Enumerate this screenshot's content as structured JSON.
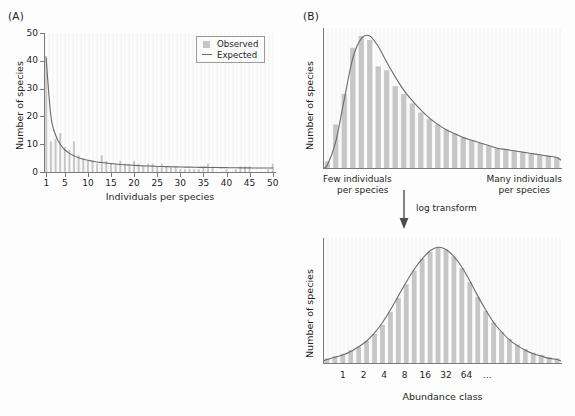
{
  "figure": {
    "panels": [
      {
        "id": "A",
        "label": "(A)"
      },
      {
        "id": "B",
        "label": "(B)"
      }
    ],
    "arrow": {
      "label": "log transform",
      "direction": "down"
    },
    "colors": {
      "bar": "#c6c6c6",
      "curve": "#6b6b6b",
      "axis": "#7a7a7a",
      "plot_background": "#f7f7f7",
      "text": "#231f20"
    }
  },
  "chart_data": [
    {
      "id": "panel-a",
      "type": "bar",
      "title": "",
      "xlabel": "Individuals per species",
      "ylabel": "Number of species",
      "xlim": [
        0.4,
        50.6
      ],
      "ylim": [
        0,
        50
      ],
      "xticks": [
        1,
        5,
        10,
        15,
        20,
        25,
        30,
        35,
        40,
        45,
        50
      ],
      "yticks": [
        0,
        10,
        20,
        30,
        40,
        50
      ],
      "grid": false,
      "legend": {
        "position": "top-right",
        "entries": [
          {
            "label": "Observed",
            "marker": "square",
            "color": "#c6c6c6"
          },
          {
            "label": "Expected",
            "marker": "line",
            "color": "#6b6b6b"
          }
        ]
      },
      "categories": [
        1,
        2,
        3,
        4,
        5,
        6,
        7,
        8,
        9,
        10,
        11,
        12,
        13,
        14,
        15,
        16,
        17,
        18,
        19,
        20,
        21,
        22,
        23,
        24,
        25,
        26,
        27,
        28,
        29,
        30,
        31,
        32,
        33,
        34,
        35,
        36,
        37,
        38,
        39,
        40,
        41,
        42,
        43,
        44,
        45,
        46,
        47,
        48,
        49,
        50
      ],
      "series": [
        {
          "name": "Observed",
          "type": "bar",
          "values": [
            41,
            11,
            12,
            14,
            9,
            8,
            11,
            6,
            5,
            4,
            4,
            3,
            6,
            4,
            3,
            3,
            4,
            3,
            3,
            4,
            3,
            2,
            3,
            3,
            2,
            3,
            2,
            2,
            2,
            1,
            1,
            1,
            1,
            1,
            2,
            3,
            2,
            0,
            0,
            1,
            0,
            1,
            2,
            2,
            2,
            0,
            0,
            0,
            1,
            3
          ]
        },
        {
          "name": "Expected",
          "type": "line",
          "values": [
            40.0,
            20.0,
            13.3,
            10.0,
            8.0,
            6.7,
            5.8,
            5.1,
            4.6,
            4.2,
            3.9,
            3.6,
            3.4,
            3.2,
            3.0,
            2.9,
            2.7,
            2.6,
            2.5,
            2.4,
            2.3,
            2.2,
            2.15,
            2.1,
            2.0,
            1.96,
            1.92,
            1.88,
            1.84,
            1.8,
            1.77,
            1.74,
            1.71,
            1.68,
            1.66,
            1.64,
            1.62,
            1.6,
            1.58,
            1.56,
            1.54,
            1.52,
            1.5,
            1.49,
            1.47,
            1.46,
            1.45,
            1.44,
            1.43,
            1.42
          ]
        }
      ]
    },
    {
      "id": "panel-b-top",
      "type": "bar",
      "title": "",
      "xlabel": "",
      "ylabel": "Number of species",
      "x_left_caption": "Few individuals per species",
      "x_right_caption": "Many individuals per species",
      "xticks": [],
      "yticks": [],
      "grid": false,
      "distribution": "lognormal (untransformed abundance)",
      "categories": [
        1,
        2,
        3,
        4,
        5,
        6,
        7,
        8,
        9,
        10,
        11,
        12,
        13,
        14,
        15,
        16,
        17,
        18,
        19,
        20,
        21,
        22,
        23,
        24,
        25,
        26,
        27,
        28
      ],
      "series": [
        {
          "name": "Observed",
          "type": "bar",
          "values": [
            5,
            33,
            56,
            91,
            100,
            97,
            77,
            74,
            62,
            56,
            49,
            42,
            37,
            33,
            29,
            26,
            23,
            21,
            19,
            17,
            15,
            14,
            13,
            12,
            11,
            10,
            9,
            8
          ]
        },
        {
          "name": "Expected",
          "type": "line",
          "values": [
            2,
            20,
            52,
            83,
            98,
            100,
            92,
            80,
            69,
            59,
            51,
            44,
            38,
            33,
            29,
            26,
            23,
            21,
            19,
            17,
            15,
            14,
            13,
            12,
            11,
            10,
            9,
            8
          ]
        }
      ]
    },
    {
      "id": "panel-b-bottom",
      "type": "bar",
      "title": "",
      "xlabel": "Abundance class",
      "ylabel": "Number of species",
      "xticks": [
        "1",
        "2",
        "4",
        "8",
        "16",
        "32",
        "64",
        "…"
      ],
      "yticks": [],
      "grid": false,
      "distribution": "normal (log2-transformed abundance)",
      "categories": [
        1,
        2,
        3,
        4,
        5,
        6,
        7,
        8,
        9,
        10,
        11,
        12,
        13,
        14,
        15,
        16,
        17,
        18,
        19,
        20,
        21,
        22,
        23,
        24,
        25,
        26,
        27,
        28,
        29,
        30
      ],
      "series": [
        {
          "name": "Observed",
          "type": "bar",
          "values": [
            4,
            6,
            8,
            11,
            14,
            19,
            25,
            33,
            44,
            56,
            68,
            80,
            90,
            96,
            100,
            98,
            92,
            82,
            70,
            57,
            45,
            35,
            27,
            21,
            16,
            12,
            9,
            7,
            5,
            4
          ]
        },
        {
          "name": "Expected",
          "type": "line",
          "values": [
            3,
            5,
            7,
            10,
            14,
            19,
            26,
            35,
            46,
            58,
            70,
            81,
            90,
            97,
            100,
            98,
            92,
            83,
            71,
            58,
            46,
            35,
            27,
            20,
            15,
            11,
            8,
            6,
            4,
            3
          ]
        }
      ]
    }
  ]
}
